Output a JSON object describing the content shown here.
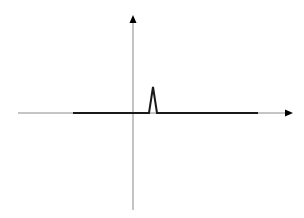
{
  "diagram": {
    "type": "signal-plot",
    "colors": {
      "background": "#ffffff",
      "axis": "#8a8a8a",
      "signal": "#1a1a1a",
      "arrow": "#000000"
    },
    "x_axis": {
      "x1": 18,
      "x2": 286,
      "y": 113,
      "arrow_tip_x": 293
    },
    "y_axis": {
      "x": 133,
      "y1": 210,
      "y2": 22,
      "arrow_tip_y": 15
    },
    "signal": {
      "baseline_start_x": 73,
      "baseline_end_x": 258,
      "baseline_y": 113,
      "pulse": {
        "left_x": 149,
        "peak_x": 153,
        "peak_y": 87,
        "right_x": 157
      }
    }
  }
}
